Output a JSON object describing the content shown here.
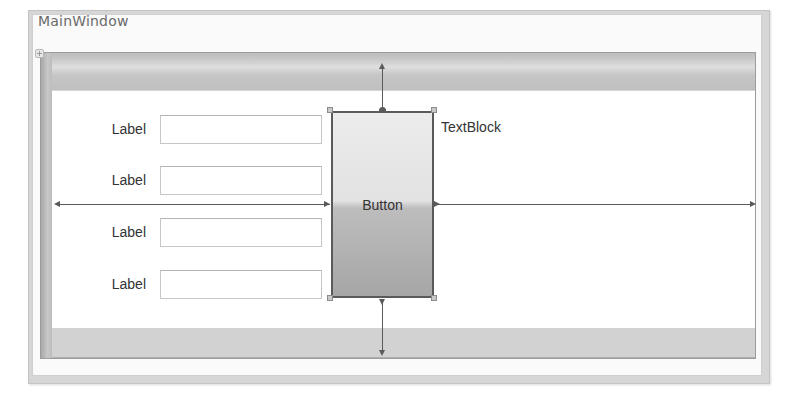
{
  "window": {
    "title": "MainWindow"
  },
  "form": {
    "rows": [
      {
        "label": "Label",
        "value": ""
      },
      {
        "label": "Label",
        "value": ""
      },
      {
        "label": "Label",
        "value": ""
      },
      {
        "label": "Label",
        "value": ""
      }
    ]
  },
  "button": {
    "label": "Button",
    "selected": true
  },
  "textblock": {
    "text": "TextBlock"
  },
  "colors": {
    "frame": "#d6d6d6",
    "row_band": "#c6c6c6",
    "button_border": "#5a5a5a",
    "text": "#333333"
  }
}
